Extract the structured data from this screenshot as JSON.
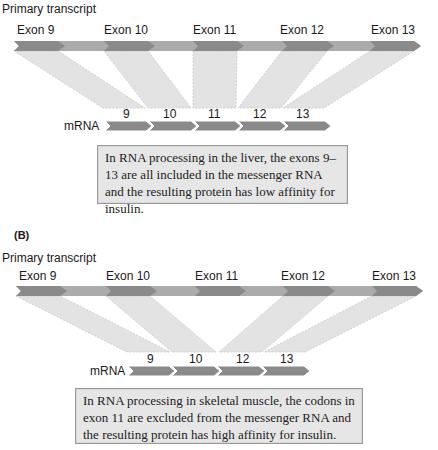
{
  "panel_a": {
    "title": "Primary transcript",
    "exons": [
      "Exon 9",
      "Exon 10",
      "Exon 11",
      "Exon 12",
      "Exon 13"
    ],
    "mrna_label": "mRNA",
    "mrna_segments": [
      "9",
      "10",
      "11",
      "12",
      "13"
    ],
    "note": "In RNA processing in the liver, the exons 9–13 are all included in the messenger RNA and the resulting protein has low affinity for insulin."
  },
  "panel_b": {
    "panel_label": "(B)",
    "title": "Primary transcript",
    "exons": [
      "Exon 9",
      "Exon 10",
      "Exon 11",
      "Exon 12",
      "Exon 13"
    ],
    "excluded_exon": "Exon 11",
    "mrna_label": "mRNA",
    "mrna_segments": [
      "9",
      "10",
      "12",
      "13"
    ],
    "note": "In RNA processing in skeletal muscle, the codons in exon 11 are excluded from the messenger RNA and the resulting protein has high affinity for insulin."
  },
  "colors": {
    "exon": "#8a8a8a",
    "intron": "#ababab",
    "mapping_fill": "#e3e3e3",
    "note_fill": "#e6e6e6"
  }
}
